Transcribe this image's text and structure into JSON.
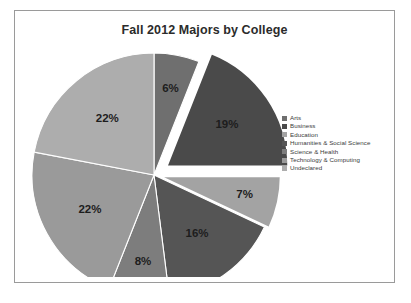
{
  "chart_data": {
    "type": "pie",
    "title": "Fall 2012 Majors by College",
    "categories": [
      "Arts",
      "Business",
      "Education",
      "Humanities & Social Science",
      "Science & Health",
      "Technology & Computing",
      "Undeclared"
    ],
    "values": [
      6,
      19,
      7,
      16,
      8,
      22,
      22
    ],
    "value_labels": [
      "6%",
      "19%",
      "7%",
      "16%",
      "8%",
      "22%",
      "22%"
    ],
    "unit": "percent",
    "legend_position": "right",
    "grid": false,
    "exploded_slices": [
      "Business",
      "Education"
    ],
    "colors": [
      "#6f6f6f",
      "#4a4a4a",
      "#a3a3a3",
      "#555555",
      "#7d7d7d",
      "#9a9a9a",
      "#adadad"
    ],
    "start_angle_deg": 0,
    "direction": "clockwise"
  },
  "frame": {
    "border_color": "#9a9a9a",
    "background": "#ffffff"
  }
}
